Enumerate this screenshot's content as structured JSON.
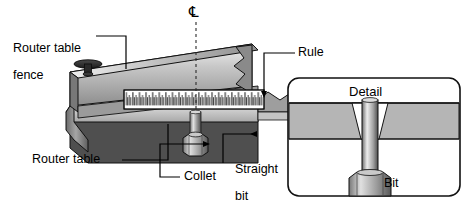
{
  "figure": {
    "type": "technical-illustration",
    "background_color": "#ffffff",
    "line_color": "#000000"
  },
  "labels": {
    "router_table_fence": {
      "line1": "Router table",
      "line2": "fence"
    },
    "rule": "Rule",
    "router_table": "Router table",
    "collet": "Collet",
    "straight_bit": {
      "line1": "Straight",
      "line2": "bit"
    },
    "bit": "Bit",
    "detail_title": "Detail",
    "centerline_symbol": "℄"
  },
  "callouts": [
    {
      "name": "router-table-fence",
      "text": "Router table fence",
      "leader": "horizontal-then-down",
      "target": "fence-top-edge"
    },
    {
      "name": "rule",
      "text": "Rule",
      "leader": "horizontal-then-down-arrow",
      "target": "rule-strip"
    },
    {
      "name": "router-table",
      "text": "Router table",
      "leader": "horizontal-then-up",
      "target": "table-top-surface"
    },
    {
      "name": "collet",
      "text": "Collet",
      "leader": "left-up-right-arrow",
      "target": "collet-nut"
    },
    {
      "name": "straight-bit",
      "text": "Straight bit",
      "leader": "up-elbow",
      "target": "bit-shaft"
    },
    {
      "name": "bit",
      "text": "Bit",
      "leader": "left-up-elbow",
      "target": "detail-bit-shaft"
    }
  ],
  "rule": {
    "description": "white measuring rule strip with graduation ticks",
    "tick_count": 64,
    "major_every": 4,
    "face_color": "#ffffff",
    "tick_color": "#1a1a1a"
  },
  "detail_box": {
    "title": "Detail",
    "border_radius_px": 10,
    "title_band_color": "#ffffff",
    "table_band_color": "#b3b3b3",
    "body_color": "#ffffff",
    "contents": [
      "table-slab-cross-section",
      "tapered-hole",
      "bit-shaft",
      "collet-nut"
    ]
  },
  "colors": {
    "fence_light": "#e8e8e8",
    "fence_mid": "#9a9a9a",
    "fence_dark": "#6f6f6f",
    "table_top": "#d6d6d6",
    "table_face": "#4a4a4a",
    "metal_light": "#f0f0f0",
    "metal_mid": "#8c8c8c",
    "metal_dark": "#3c3c3c",
    "knob": "#262626"
  }
}
